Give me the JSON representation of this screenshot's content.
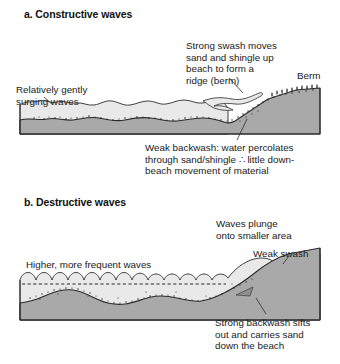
{
  "figure": {
    "background_color": "#ffffff",
    "colors": {
      "sea": "#e9e9e9",
      "ground": "#a9a9a9",
      "outline": "#2b2b2b",
      "text": "#1a1a1a",
      "sediment": "#222222"
    }
  },
  "panels": {
    "a": {
      "title": "a. Constructive waves",
      "labels": {
        "gentle_waves": "Relatively gently\nsurging waves",
        "strong_swash": "Strong swash moves\nsand and shingle up\nbeach to form a\nridge (berm)",
        "berm": "Berm",
        "weak_backwash": "Weak backwash: water percolates\nthrough sand/shingle ∴ little down-\nbeach movement of material"
      }
    },
    "b": {
      "title": "b. Destructive waves",
      "labels": {
        "higher_waves": "Higher, more frequent waves",
        "waves_plunge": "Waves plunge\nonto smaller area",
        "weak_swash": "Weak swash",
        "strong_backwash": "Strong backwash sifts\nout and carries sand\ndown the beach"
      }
    }
  }
}
